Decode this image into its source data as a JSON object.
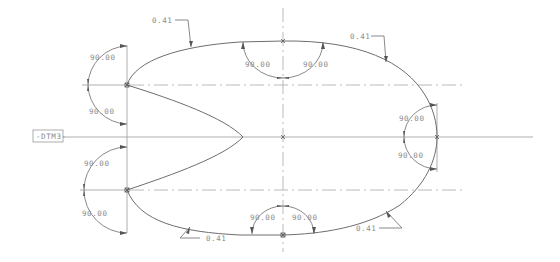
{
  "drawing": {
    "datum_label": "-DTM3-",
    "angle_dims": {
      "left_upper_top": "90.00",
      "left_upper_bottom": "90.00",
      "left_lower_top": "90.00",
      "left_lower_bottom": "90.00",
      "top_left": "90.00",
      "top_right": "90.00",
      "bottom_left": "90.00",
      "bottom_right": "90.00",
      "right_top": "90.00",
      "right_bottom": "90.00"
    },
    "leader_dims": {
      "top_left": "0.41",
      "top_right": "0.41",
      "bottom_left": "0.41",
      "bottom_right": "0.41"
    },
    "colors": {
      "geometry": "#6e6e6e",
      "centerline": "#a8a8a8",
      "text": "#8a8a8a",
      "background": "#ffffff"
    }
  }
}
